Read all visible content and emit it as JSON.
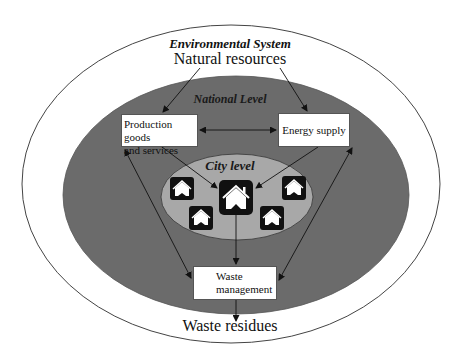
{
  "diagram": {
    "environmental_system": "Environmental System",
    "natural_resources": "Natural resources",
    "national_level": "National Level",
    "city_level": "City level",
    "waste_residues": "Waste residues",
    "boxes": {
      "production": {
        "line1": "Production goods",
        "line2": "and services"
      },
      "energy": "Energy supply",
      "waste": {
        "line1": "Waste",
        "line2": "management"
      }
    },
    "icons": {
      "house": "house-icon"
    },
    "colors": {
      "outer_fill": "#ffffff",
      "national_fill": "#6b6b6b",
      "city_fill": "#a8a8a8",
      "stroke": "#333333",
      "icon_bg": "#111111"
    }
  }
}
